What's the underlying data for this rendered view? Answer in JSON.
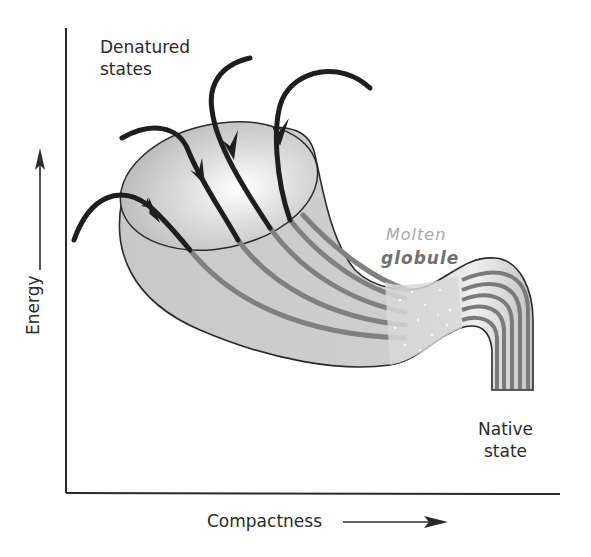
{
  "diagram": {
    "type": "protein-folding-energy-funnel",
    "labels": {
      "denatured_line1": "Denatured",
      "denatured_line2": "states",
      "molten_line1": "Molten",
      "molten_line2": "globule",
      "native_line1": "Native",
      "native_line2": "state"
    },
    "axes": {
      "y_label": "Energy",
      "x_label": "Compactness",
      "y_direction": "up-arrow",
      "x_direction": "right-arrow"
    },
    "pathways": {
      "count": 5,
      "description": "Black arrows entering funnel mouth from denatured states, continuing as gray stripes to molten globule then native state"
    },
    "colors": {
      "axis": "#2a2a2a",
      "arrow": "#1e1e1e",
      "funnel_fill": "#c9c9c9",
      "funnel_light": "#f2f2f2",
      "stripe": "#808080",
      "molten_light": "#a8a8a8",
      "molten_dark": "#707070"
    }
  }
}
